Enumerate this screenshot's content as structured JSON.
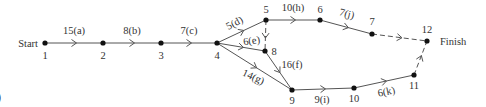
{
  "diagram": {
    "type": "activity-network",
    "start_label": "Start",
    "finish_label": "Finish",
    "partial_left_glyph": ")",
    "nodes": [
      {
        "id": "1",
        "x": 45,
        "y": 43,
        "label": "1",
        "lx": 45,
        "ly": 59
      },
      {
        "id": "2",
        "x": 103,
        "y": 43,
        "label": "2",
        "lx": 103,
        "ly": 59
      },
      {
        "id": "3",
        "x": 161,
        "y": 43,
        "label": "3",
        "lx": 161,
        "ly": 59
      },
      {
        "id": "4",
        "x": 217,
        "y": 43,
        "label": "4",
        "lx": 217,
        "ly": 59
      },
      {
        "id": "5",
        "x": 266,
        "y": 20,
        "label": "5",
        "lx": 266,
        "ly": 13
      },
      {
        "id": "6",
        "x": 320,
        "y": 20,
        "label": "6",
        "lx": 320,
        "ly": 13
      },
      {
        "id": "7",
        "x": 372,
        "y": 34,
        "label": "7",
        "lx": 372,
        "ly": 25
      },
      {
        "id": "8",
        "x": 265,
        "y": 51,
        "label": "8",
        "lx": 274,
        "ly": 55
      },
      {
        "id": "9",
        "x": 292,
        "y": 90,
        "label": "9",
        "lx": 292,
        "ly": 104
      },
      {
        "id": "10",
        "x": 354,
        "y": 88,
        "label": "10",
        "lx": 354,
        "ly": 102
      },
      {
        "id": "11",
        "x": 414,
        "y": 75,
        "label": "11",
        "lx": 414,
        "ly": 89
      },
      {
        "id": "12",
        "x": 427,
        "y": 41,
        "label": "12",
        "lx": 427,
        "ly": 33
      }
    ],
    "edges": [
      {
        "from": "1",
        "to": "2",
        "label": "15(a)",
        "dashed": false,
        "lx": 74,
        "ly": 34
      },
      {
        "from": "2",
        "to": "3",
        "label": "8(b)",
        "dashed": false,
        "lx": 132,
        "ly": 34
      },
      {
        "from": "3",
        "to": "4",
        "label": "7(c)",
        "dashed": false,
        "lx": 189,
        "ly": 34
      },
      {
        "from": "4",
        "to": "5",
        "label": "5(d)",
        "dashed": false,
        "lx": 236,
        "ly": 26,
        "rot": -28
      },
      {
        "from": "4",
        "to": "8",
        "label": "6(e)",
        "dashed": false,
        "lx": 252,
        "ly": 44,
        "rot": -8
      },
      {
        "from": "5",
        "to": "8",
        "label": "",
        "dashed": true
      },
      {
        "from": "8",
        "to": "9",
        "label": "16(f)",
        "dashed": false,
        "lx": 292,
        "ly": 68
      },
      {
        "from": "4",
        "to": "9",
        "label": "14(g)",
        "dashed": false,
        "lx": 252,
        "ly": 80,
        "rot": 24
      },
      {
        "from": "5",
        "to": "6",
        "label": "10(h)",
        "dashed": false,
        "lx": 293,
        "ly": 11
      },
      {
        "from": "9",
        "to": "10",
        "label": "9(i)",
        "dashed": false,
        "lx": 322,
        "ly": 103
      },
      {
        "from": "6",
        "to": "7",
        "label": "7(j)",
        "dashed": false,
        "lx": 346,
        "ly": 17,
        "rot": 15
      },
      {
        "from": "10",
        "to": "11",
        "label": "6(k)",
        "dashed": false,
        "lx": 387,
        "ly": 95,
        "rot": -12
      },
      {
        "from": "7",
        "to": "12",
        "label": "",
        "dashed": true
      },
      {
        "from": "11",
        "to": "12",
        "label": "",
        "dashed": true
      }
    ]
  }
}
